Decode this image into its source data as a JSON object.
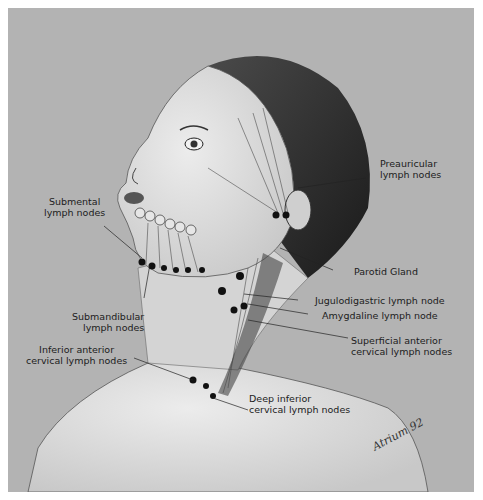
{
  "figure": {
    "labels": {
      "preauricular": "Preauricular\nlymph nodes",
      "submental": "Submental\nlymph nodes",
      "parotid": "Parotid Gland",
      "jugulodigastric": "Jugulodigastric lymph node",
      "amygdaline": "Amygdaline lymph node",
      "submandibular": "Submandibular\nlymph nodes",
      "superficial_anterior": "Superficial anterior\ncervical lymph nodes",
      "inferior_anterior": "Inferior anterior\ncervical lymph nodes",
      "deep_inferior": "Deep inferior\ncervical lymph nodes"
    },
    "signature": "Atrium 92",
    "colors": {
      "background": "#b3b3b3",
      "skin": "#d9d9d9",
      "hair": "#2a2a2a",
      "ink": "#1c1c1c"
    }
  }
}
